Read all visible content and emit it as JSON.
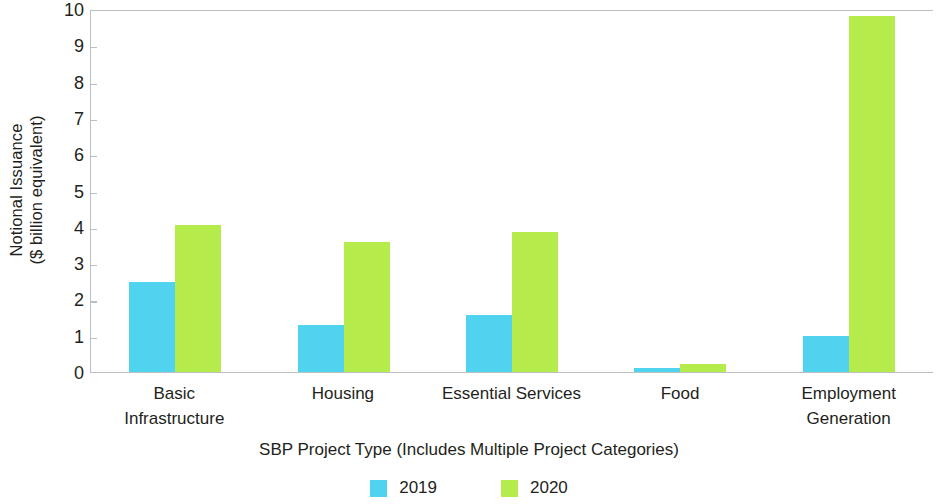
{
  "chart_data": {
    "type": "bar",
    "title": "",
    "xlabel": "SBP Project Type (Includes Multiple Project Categories)",
    "ylabel_line1": "Notional Issuance",
    "ylabel_line2": "($ billion equivalent)",
    "categories": [
      {
        "line1": "Basic",
        "line2": "Infrastructure"
      },
      {
        "line1": "Housing",
        "line2": ""
      },
      {
        "line1": "Essential Services",
        "line2": ""
      },
      {
        "line1": "Food",
        "line2": ""
      },
      {
        "line1": "Employment",
        "line2": "Generation"
      }
    ],
    "category_labels": [
      "Basic Infrastructure",
      "Housing",
      "Essential Services",
      "Food",
      "Employment Generation"
    ],
    "series": [
      {
        "name": "2019",
        "color": "#4fd3ee",
        "values": [
          2.48,
          1.3,
          1.58,
          0.1,
          0.98
        ]
      },
      {
        "name": "2020",
        "color": "#b5ec4b",
        "values": [
          4.05,
          3.57,
          3.85,
          0.22,
          9.8
        ]
      }
    ],
    "ylim": [
      0,
      10
    ],
    "yticks": [
      0,
      1,
      2,
      3,
      4,
      5,
      6,
      7,
      8,
      9,
      10
    ],
    "ytick_labels": [
      "0",
      "1",
      "2",
      "3",
      "4",
      "5",
      "6",
      "7",
      "8",
      "9",
      "10"
    ],
    "grid": false,
    "legend_position": "bottom",
    "axis_color": "#b9bfc4"
  }
}
